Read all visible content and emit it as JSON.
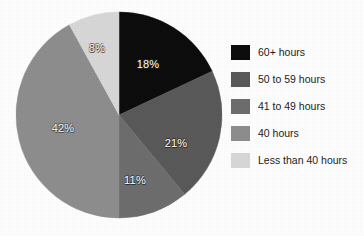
{
  "chart_data": {
    "type": "pie",
    "title": "",
    "subtitle": "",
    "xlabel": "",
    "ylabel": "",
    "legend_position": "right",
    "grid": false,
    "start_angle_deg": 0,
    "direction": "clockwise",
    "categories": [
      "60+ hours",
      "50 to 59 hours",
      "41 to 49 hours",
      "40 hours",
      "Less than 40 hours"
    ],
    "values": [
      18,
      21,
      11,
      42,
      8
    ],
    "labels": [
      "18%",
      "21%",
      "11%",
      "42%",
      "8%"
    ],
    "colors": [
      "#0d0d0d",
      "#5a5a5a",
      "#6e6e6e",
      "#8e8e8e",
      "#d8d8d8"
    ]
  },
  "pie": {
    "center_x": 119,
    "center_y": 115,
    "radius": 103,
    "slices": [
      {
        "name": "60+ hours",
        "value": 18,
        "label": "18%",
        "color": "#0d0d0d",
        "label_x": 148,
        "label_y": 64,
        "label_class": "slice-label"
      },
      {
        "name": "50 to 59 hours",
        "value": 21,
        "label": "21%",
        "color": "#5a5a5a",
        "label_x": 176,
        "label_y": 143,
        "label_class": "slice-label"
      },
      {
        "name": "41 to 49 hours",
        "value": 11,
        "label": "11%",
        "color": "#6e6e6e",
        "label_x": 135,
        "label_y": 180,
        "label_class": "slice-label"
      },
      {
        "name": "40 hours",
        "value": 42,
        "label": "42%",
        "color": "#8e8e8e",
        "label_x": 63,
        "label_y": 128,
        "label_class": "slice-label on-light"
      },
      {
        "name": "Less than 40 hours",
        "value": 8,
        "label": "8%",
        "color": "#d8d8d8",
        "label_x": 97,
        "label_y": 48,
        "label_class": "slice-label on-light"
      }
    ]
  },
  "legend": {
    "items": [
      {
        "label": "60+ hours",
        "color": "#0d0d0d",
        "swatch_name": "legend-swatch-60-plus-hours"
      },
      {
        "label": "50 to 59 hours",
        "color": "#5a5a5a",
        "swatch_name": "legend-swatch-50-to-59-hours"
      },
      {
        "label": "41 to 49 hours",
        "color": "#6e6e6e",
        "swatch_name": "legend-swatch-41-to-49-hours"
      },
      {
        "label": "40 hours",
        "color": "#8e8e8e",
        "swatch_name": "legend-swatch-40-hours"
      },
      {
        "label": "Less than 40 hours",
        "color": "#d8d8d8",
        "swatch_name": "legend-swatch-less-than-40-hours"
      }
    ]
  }
}
